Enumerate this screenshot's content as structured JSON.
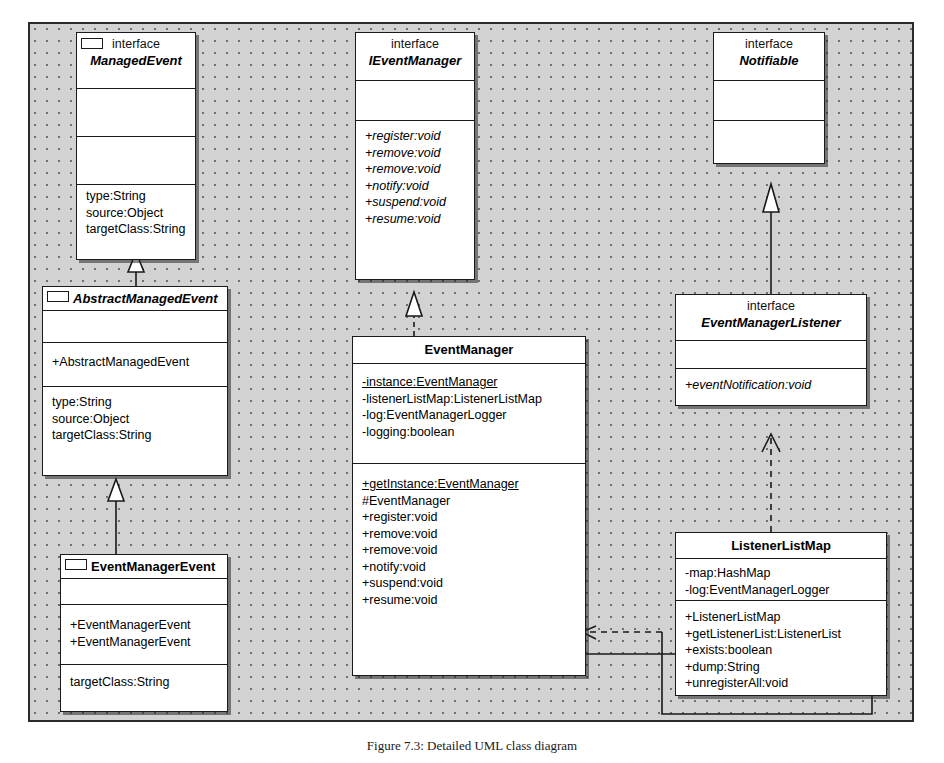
{
  "figure": {
    "caption": "Figure 7.3: Detailed UML class diagram"
  },
  "diagram": {
    "title": "Detailed UML class diagram",
    "type": "uml-class-diagram",
    "background_color": "#d2d2d2",
    "box_fill_color": "#ffffff",
    "line_color": "#1a1a1a"
  },
  "classes": [
    {
      "id": "managed-event",
      "stereotype": "interface",
      "name": "ManagedEvent",
      "abstract": true,
      "has_lug": true,
      "compartments": [
        {
          "members": []
        },
        {
          "members": []
        },
        {
          "members": [
            {
              "text": "type:String"
            },
            {
              "text": "source:Object"
            },
            {
              "text": "targetClass:String"
            }
          ]
        }
      ]
    },
    {
      "id": "ievent-manager",
      "stereotype": "interface",
      "name": "IEventManager",
      "abstract": true,
      "has_lug": false,
      "compartments": [
        {
          "members": []
        },
        {
          "members": [
            {
              "text": "+register:void",
              "italic": true
            },
            {
              "text": "+remove:void",
              "italic": true
            },
            {
              "text": "+remove:void",
              "italic": true
            },
            {
              "text": "+notify:void",
              "italic": true
            },
            {
              "text": "+suspend:void",
              "italic": true
            },
            {
              "text": "+resume:void",
              "italic": true
            }
          ]
        }
      ]
    },
    {
      "id": "notifiable",
      "stereotype": "interface",
      "name": "Notifiable",
      "abstract": true,
      "has_lug": false,
      "compartments": [
        {
          "members": []
        },
        {
          "members": []
        }
      ]
    },
    {
      "id": "abstract-managed-event",
      "stereotype": "",
      "name": "AbstractManagedEvent",
      "abstract": true,
      "has_lug": true,
      "compartments": [
        {
          "members": []
        },
        {
          "members": [
            {
              "text": "+AbstractManagedEvent"
            }
          ]
        },
        {
          "members": [
            {
              "text": "type:String"
            },
            {
              "text": "source:Object"
            },
            {
              "text": "targetClass:String"
            }
          ]
        }
      ]
    },
    {
      "id": "event-manager-listener",
      "stereotype": "interface",
      "name": "EventManagerListener",
      "abstract": true,
      "has_lug": false,
      "compartments": [
        {
          "members": []
        },
        {
          "members": [
            {
              "text": "+eventNotification:void",
              "italic": true
            }
          ]
        }
      ]
    },
    {
      "id": "event-manager",
      "stereotype": "",
      "name": "EventManager",
      "abstract": false,
      "has_lug": false,
      "compartments": [
        {
          "members": [
            {
              "text": "-instance:EventManager",
              "static": true
            },
            {
              "text": "-listenerListMap:ListenerListMap"
            },
            {
              "text": "-log:EventManagerLogger"
            },
            {
              "text": "-logging:boolean"
            }
          ]
        },
        {
          "members": [
            {
              "text": "+getInstance:EventManager",
              "static": true
            },
            {
              "text": "#EventManager"
            },
            {
              "text": "+register:void"
            },
            {
              "text": "+remove:void"
            },
            {
              "text": "+remove:void"
            },
            {
              "text": "+notify:void"
            },
            {
              "text": "+suspend:void"
            },
            {
              "text": "+resume:void"
            }
          ]
        }
      ]
    },
    {
      "id": "listener-list-map",
      "stereotype": "",
      "name": "ListenerListMap",
      "abstract": false,
      "has_lug": false,
      "compartments": [
        {
          "members": [
            {
              "text": "-map:HashMap"
            },
            {
              "text": "-log:EventManagerLogger"
            }
          ]
        },
        {
          "members": [
            {
              "text": "+ListenerListMap"
            },
            {
              "text": "+getListenerList:ListenerList"
            },
            {
              "text": "+exists:boolean"
            },
            {
              "text": "+dump:String"
            },
            {
              "text": "+unregisterAll:void"
            }
          ]
        }
      ]
    },
    {
      "id": "event-manager-event",
      "stereotype": "",
      "name": "EventManagerEvent",
      "abstract": false,
      "has_lug": true,
      "compartments": [
        {
          "members": []
        },
        {
          "members": [
            {
              "text": "+EventManagerEvent"
            },
            {
              "text": "+EventManagerEvent"
            }
          ]
        },
        {
          "members": [
            {
              "text": "targetClass:String"
            }
          ]
        }
      ]
    }
  ],
  "relationships": [
    {
      "from": "abstract-managed-event",
      "to": "managed-event",
      "kind": "realization",
      "line": "solid",
      "head": "hollow-triangle"
    },
    {
      "from": "event-manager-event",
      "to": "abstract-managed-event",
      "kind": "generalization",
      "line": "solid",
      "head": "hollow-triangle"
    },
    {
      "from": "event-manager",
      "to": "ievent-manager",
      "kind": "realization",
      "line": "dashed",
      "head": "hollow-triangle"
    },
    {
      "from": "event-manager-listener",
      "to": "notifiable",
      "kind": "generalization",
      "line": "solid",
      "head": "hollow-triangle"
    },
    {
      "from": "listener-list-map",
      "to": "event-manager-listener",
      "kind": "realization",
      "line": "dashed",
      "head": "open-arrow"
    },
    {
      "from": "listener-list-map",
      "to": "event-manager",
      "kind": "dependency",
      "line": "dashed",
      "head": "open-arrow"
    },
    {
      "from": "event-manager",
      "to": "listener-list-map",
      "kind": "association",
      "line": "solid",
      "head": "open-arrow"
    }
  ]
}
